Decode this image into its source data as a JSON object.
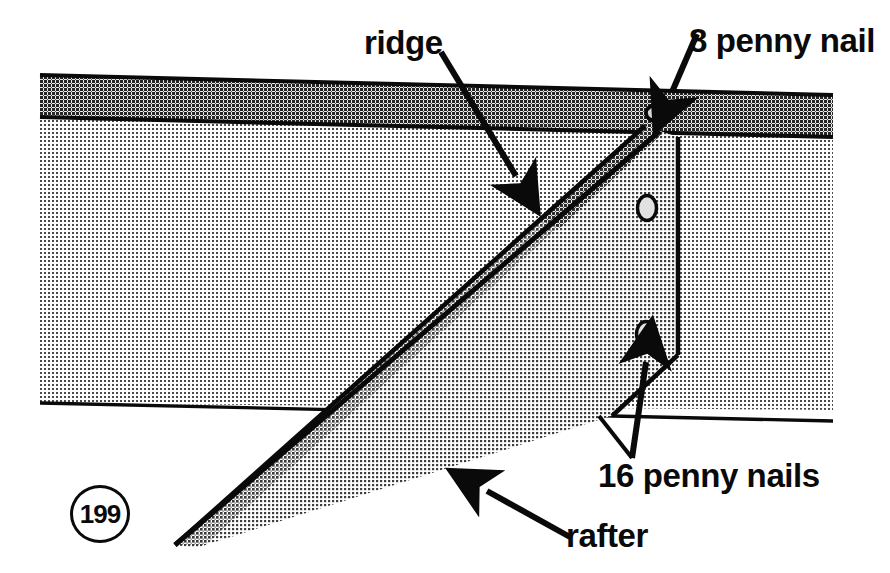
{
  "figure": {
    "number": "199",
    "background_color": "#ffffff",
    "line_color": "#0a0a0a"
  },
  "labels": {
    "ridge": "ridge",
    "eight_penny_nail": "8 penny nail",
    "sixteen_penny_nails": "16 penny nails",
    "rafter": "rafter"
  },
  "parts": [
    {
      "name": "ridge-board",
      "label": "ridge",
      "fill": "#8e8e8e",
      "description": "horizontal board across top of drawing"
    },
    {
      "name": "wall-panel",
      "fill": "#c9c9c9",
      "description": "large light panel below ridge board"
    },
    {
      "name": "rafter",
      "label": "rafter",
      "fill": "#d2d2d2",
      "description": "diagonal member butting into ridge board"
    },
    {
      "name": "rafter-edge",
      "fill": "#9a9a9a",
      "description": "narrow shaded thickness strip along rafter top"
    }
  ],
  "fasteners": [
    {
      "name": "eight-penny-nail",
      "label": "8 penny nail",
      "count": 1,
      "location": "through ridge board face",
      "cx": 660,
      "cy": 113
    },
    {
      "name": "sixteen-penny-nail-upper",
      "label": "16 penny nails",
      "count": 1,
      "location": "upper rafter end",
      "cx": 647,
      "cy": 208
    },
    {
      "name": "sixteen-penny-nail-lower",
      "label": "16 penny nails",
      "count": 1,
      "location": "lower rafter end",
      "cx": 646,
      "cy": 334
    }
  ],
  "leaders": [
    {
      "name": "ridge-leader",
      "from": [
        441,
        52
      ],
      "to": [
        523,
        188
      ]
    },
    {
      "name": "eight-penny-leader",
      "from": [
        696,
        36
      ],
      "to": [
        668,
        104
      ]
    },
    {
      "name": "sixteen-penny-leader",
      "from": [
        632,
        458
      ],
      "to": [
        646,
        352
      ]
    },
    {
      "name": "rafter-leader",
      "from": [
        568,
        536
      ],
      "to": [
        481,
        487
      ]
    }
  ]
}
